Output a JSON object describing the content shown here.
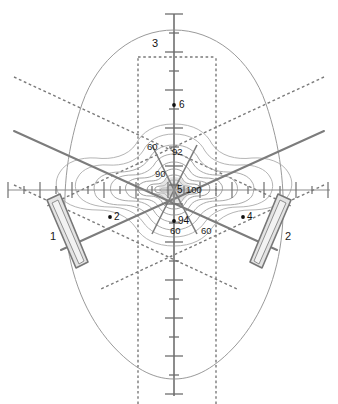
{
  "figure": {
    "background_color": "#ffffff"
  },
  "colors": {
    "head_outline": "#9a9a9a",
    "axis": "#8c8c8c",
    "axis_tick": "#6f6f6f",
    "beam_solid": "#7c7c7c",
    "beam_dashed": "#7a7a7a",
    "contour": "#a2a2a2",
    "contour_dark": "#8a8a8a",
    "transducer_stroke": "#777777",
    "transducer_fill": "#e3e3e3",
    "focus_blob": "#c9c9c9",
    "marker_dot": "#101010",
    "label_text": "#111111"
  },
  "axes": {
    "origin": {
      "x": 174,
      "y": 190
    },
    "vertical": {
      "name": "vertical-axis",
      "x": 174,
      "y_top": 14,
      "y_bottom": 396,
      "tick_spacing": 19,
      "minor_tick_half_len": 5,
      "major_tick_half_len": 9,
      "major_every": 2
    },
    "horizontal": {
      "name": "horizontal-axis",
      "y": 190,
      "x_left": 8,
      "x_right": 330,
      "tick_spacing": 16,
      "minor_tick_half_len": 4,
      "major_tick_half_len": 8,
      "major_every": 2
    }
  },
  "axis_labels": [
    {
      "text": "3",
      "x": 158,
      "y": 38,
      "anchor": "end",
      "name": "axis-label-3"
    }
  ],
  "markers": [
    {
      "label": "6",
      "dot_x": 174,
      "dot_y": 105,
      "label_x": 179,
      "label_y": 100,
      "name": "marker-point-6"
    },
    {
      "label": "2",
      "dot_x": 110,
      "dot_y": 217,
      "label_x": 114,
      "label_y": 212,
      "name": "marker-point-2"
    },
    {
      "label": "4",
      "dot_x": 243,
      "dot_y": 217,
      "label_x": 247,
      "label_y": 212,
      "name": "marker-point-4"
    },
    {
      "label": "94",
      "dot_x": 174,
      "dot_y": 221,
      "label_x": 178,
      "label_y": 216,
      "name": "marker-point-94"
    },
    {
      "label": "5",
      "dot_x": 174,
      "dot_y": 190,
      "label_x": 177,
      "label_y": 185,
      "name": "marker-point-5"
    }
  ],
  "contour_labels": [
    {
      "text": "60",
      "x": 147,
      "y": 142,
      "name": "contour-label-60-upper-left"
    },
    {
      "text": "92",
      "x": 172,
      "y": 147,
      "name": "contour-label-92"
    },
    {
      "text": "90",
      "x": 155,
      "y": 169,
      "name": "contour-label-90"
    },
    {
      "text": "100",
      "x": 186,
      "y": 185,
      "name": "contour-label-100"
    },
    {
      "text": "60",
      "x": 170,
      "y": 226,
      "name": "contour-label-60-lower-left"
    },
    {
      "text": "60",
      "x": 201,
      "y": 226,
      "name": "contour-label-60-lower-right"
    }
  ],
  "device_labels": [
    {
      "text": "1",
      "x": 50,
      "y": 231,
      "name": "transducer-label-1"
    },
    {
      "text": "2",
      "x": 285,
      "y": 231,
      "name": "transducer-label-2"
    }
  ],
  "contour_levels": [
    100,
    94,
    92,
    90,
    60
  ],
  "head_outline": {
    "name": "head-outline",
    "center_x": 174,
    "center_y": 195,
    "rx": 114,
    "ry": 165
  },
  "transducers": [
    {
      "name": "transducer-element-1",
      "side": "left",
      "label": "1",
      "outer": "47,200 60,194 88,262 76,268",
      "inner": "52,203 58,200 84,261 79,264"
    },
    {
      "name": "transducer-element-2",
      "side": "right",
      "label": "2",
      "outer": "291,200 278,194 250,262 262,268",
      "inner": "286,203 280,200 254,261 259,264"
    }
  ],
  "beam_axes": [
    {
      "name": "beam-axis-left",
      "x1": 14,
      "y1": 131,
      "x2": 277,
      "y2": 250
    },
    {
      "name": "beam-axis-right",
      "x1": 324,
      "y1": 131,
      "x2": 61,
      "y2": 250
    }
  ],
  "beam_boundaries_dashed": [
    {
      "name": "beam-boundary-left-upper",
      "x1": 14,
      "y1": 77,
      "x2": 291,
      "y2": 206
    },
    {
      "name": "beam-boundary-left-lower",
      "x1": 14,
      "y1": 185,
      "x2": 237,
      "y2": 289
    },
    {
      "name": "beam-boundary-right-upper",
      "x1": 324,
      "y1": 77,
      "x2": 47,
      "y2": 206
    },
    {
      "name": "beam-boundary-right-lower",
      "x1": 324,
      "y1": 185,
      "x2": 101,
      "y2": 289
    }
  ],
  "dashed_region": {
    "name": "dashed-rectangular-region",
    "left_x": 138,
    "right_x": 216,
    "top_y": 57,
    "bottom_y": 404
  },
  "chart_data": {
    "type": "contour",
    "xlabel": "",
    "ylabel": "",
    "grid": false,
    "legend": "none",
    "contour_levels": [
      60,
      90,
      92,
      94,
      100
    ],
    "labeled_contours": [
      {
        "level": 100,
        "label_position": {
          "x": 186,
          "y": 185
        }
      },
      {
        "level": 94,
        "label_position": {
          "x": 178,
          "y": 216
        }
      },
      {
        "level": 92,
        "label_position": {
          "x": 172,
          "y": 147
        }
      },
      {
        "level": 90,
        "label_position": {
          "x": 155,
          "y": 169
        }
      },
      {
        "level": 60,
        "label_position": {
          "x": 147,
          "y": 142
        }
      },
      {
        "level": 60,
        "label_position": {
          "x": 170,
          "y": 226
        }
      },
      {
        "level": 60,
        "label_position": {
          "x": 201,
          "y": 226
        }
      }
    ],
    "peak": {
      "value": 100,
      "x": 174,
      "y": 190
    },
    "annotation_points": [
      {
        "label": "2",
        "x": 110,
        "y": 217
      },
      {
        "label": "3",
        "x": 174,
        "y": 41
      },
      {
        "label": "4",
        "x": 243,
        "y": 217
      },
      {
        "label": "6",
        "x": 174,
        "y": 105
      }
    ],
    "devices": [
      {
        "label": "1",
        "type": "transducer",
        "side": "left"
      },
      {
        "label": "2",
        "type": "transducer",
        "side": "right"
      }
    ]
  }
}
